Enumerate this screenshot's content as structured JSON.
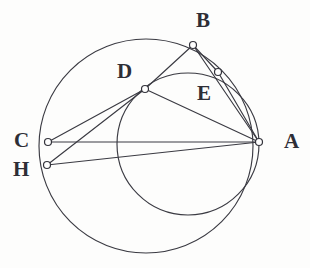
{
  "figure": {
    "kind": "euclidean-geometry-diagram",
    "background_color": "#fdfdfc",
    "ink_color": "#3a3a42",
    "vertex_fill_color": "#fefefe",
    "canvas": {
      "width": 310,
      "height": 268
    },
    "circles": [
      {
        "id": "circumcircle-large",
        "name": "large-circle",
        "cx": 146,
        "cy": 146,
        "r": 107
      },
      {
        "id": "circle-small",
        "name": "small-circle",
        "cx": 188,
        "cy": 144,
        "r": 71
      }
    ],
    "points": [
      {
        "id": "A",
        "label": "A",
        "x": 259,
        "y": 142,
        "label_x": 284,
        "label_y": 131
      },
      {
        "id": "B",
        "label": "B",
        "x": 193,
        "y": 45,
        "label_x": 196,
        "label_y": 10
      },
      {
        "id": "C",
        "label": "C",
        "x": 48,
        "y": 142,
        "label_x": 14,
        "label_y": 130
      },
      {
        "id": "D",
        "label": "D",
        "x": 145,
        "y": 89,
        "label_x": 117,
        "label_y": 61
      },
      {
        "id": "E",
        "label": "E",
        "x": 218,
        "y": 72,
        "label_x": 197,
        "label_y": 83
      },
      {
        "id": "H",
        "label": "H",
        "x": 47,
        "y": 165,
        "label_x": 13,
        "label_y": 159
      }
    ],
    "segments": [
      {
        "id": "CA",
        "name": "segment-c-a",
        "from": "C",
        "to": "A"
      },
      {
        "id": "HA",
        "name": "segment-h-a",
        "from": "H",
        "to": "A"
      },
      {
        "id": "HD",
        "name": "segment-h-d",
        "from": "H",
        "to": "D"
      },
      {
        "id": "CD",
        "name": "segment-c-d",
        "from": "C",
        "to": "D"
      },
      {
        "id": "DA",
        "name": "segment-d-a",
        "from": "D",
        "to": "A"
      },
      {
        "id": "DB",
        "name": "segment-d-b",
        "from": "D",
        "to": "B"
      },
      {
        "id": "BA",
        "name": "segment-b-a",
        "from": "B",
        "to": "A"
      },
      {
        "id": "BE",
        "name": "segment-b-e",
        "from": "B",
        "to": "E"
      },
      {
        "id": "EA",
        "name": "segment-e-a",
        "from": "E",
        "to": "A"
      }
    ]
  }
}
